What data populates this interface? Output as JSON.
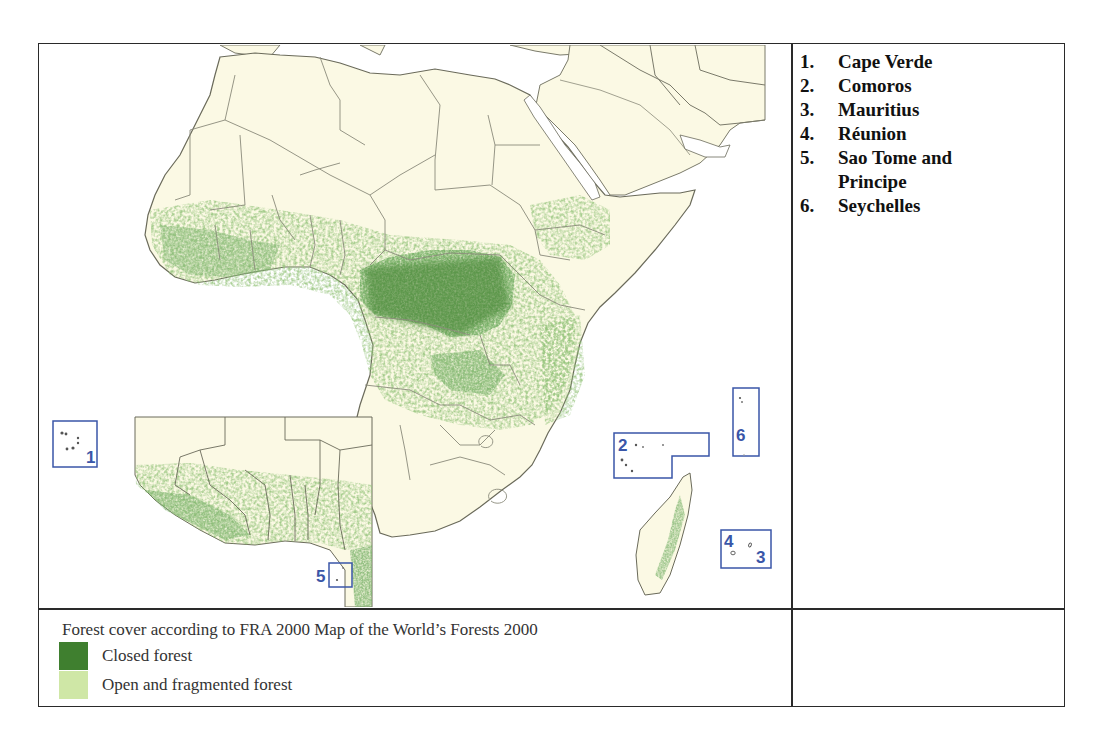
{
  "map": {
    "title": "Forest cover map of Africa (FRA 2000)",
    "colors": {
      "ocean": "#ffffff",
      "land": "#fbf9e4",
      "border": "#7a7a6a",
      "closed_forest": "#3f7f2f",
      "open_forest": "#c5df9c",
      "island_box": "#3a56a8"
    },
    "island_boxes": [
      {
        "number": "1",
        "country": "Cape Verde"
      },
      {
        "number": "2",
        "country": "Comoros"
      },
      {
        "number": "3",
        "country": "Mauritius"
      },
      {
        "number": "4",
        "country": "Réunion"
      },
      {
        "number": "5",
        "country": "Sao Tome and Principe"
      },
      {
        "number": "6",
        "country": "Seychelles"
      }
    ],
    "inset": "West Africa enlargement"
  },
  "country_list": [
    {
      "number": "1.",
      "name": "Cape Verde"
    },
    {
      "number": "2.",
      "name": "Comoros"
    },
    {
      "number": "3.",
      "name": "Mauritius"
    },
    {
      "number": "4.",
      "name": "Réunion"
    },
    {
      "number": "5.",
      "name": "Sao Tome and Principe"
    },
    {
      "number": "6.",
      "name": "Seychelles"
    }
  ],
  "legend": {
    "title": "Forest cover according to FRA 2000 Map of the World’s Forests 2000",
    "items": [
      {
        "label": "Closed forest",
        "color": "#3f7f2f"
      },
      {
        "label": "Open and fragmented forest",
        "color": "#c9e3a0"
      }
    ]
  }
}
